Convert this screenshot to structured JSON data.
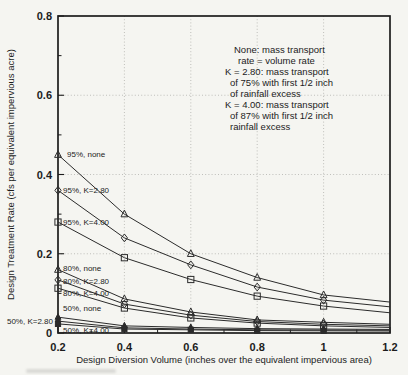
{
  "figure": {
    "background": "#f5f5f1",
    "frame_color": "#1d1d1d",
    "grid_color": "#b9b9b4",
    "line_color": "#2b2b2b",
    "text_color": "#1c1c1c"
  },
  "chart_data": {
    "type": "line",
    "title": "",
    "xlabel": "Design Diversion Volume (inches over the equivalent impervious area)",
    "ylabel": "Design Treatment Rate (cfs per equivalent impervious acre)",
    "xlim": [
      0.2,
      1.2
    ],
    "ylim": [
      0,
      0.8
    ],
    "x_ticks": [
      0.2,
      0.4,
      0.6,
      0.8,
      1.0,
      1.2
    ],
    "x_tick_labels": [
      "0.2",
      "0.4",
      "0.6",
      "0.8",
      "1",
      "1.2"
    ],
    "x_minor_ticks": [
      0.3,
      0.5,
      0.7,
      0.9,
      1.1
    ],
    "y_ticks": [
      0,
      0.2,
      0.4,
      0.6,
      0.8
    ],
    "y_tick_labels": [
      "0",
      "0.2",
      "0.4",
      "0.6",
      "0.8"
    ],
    "y_minor_ticks": [
      0.1,
      0.3,
      0.5,
      0.7
    ],
    "grid": "dotted at major ticks",
    "legend_position": "note block upper right inside plot",
    "x": [
      0.2,
      0.4,
      0.6,
      0.8,
      1.0,
      1.2
    ],
    "markers_on_last_point": false,
    "series": [
      {
        "name": "95%, none",
        "marker": "triangle-open",
        "values": [
          0.45,
          0.3,
          0.2,
          0.14,
          0.096,
          0.078
        ]
      },
      {
        "name": "95%, K=2.80",
        "marker": "diamond-open",
        "values": [
          0.36,
          0.24,
          0.172,
          0.116,
          0.083,
          0.066
        ]
      },
      {
        "name": "95%, K=4.00",
        "marker": "square-open",
        "values": [
          0.28,
          0.19,
          0.135,
          0.093,
          0.068,
          0.051
        ]
      },
      {
        "name": "80%, none",
        "marker": "triangle-open",
        "values": [
          0.16,
          0.086,
          0.053,
          0.033,
          0.027,
          0.022
        ]
      },
      {
        "name": "80%, K=2.80",
        "marker": "diamond-open",
        "values": [
          0.134,
          0.073,
          0.045,
          0.029,
          0.022,
          0.018
        ]
      },
      {
        "name": "80%, K=4.00",
        "marker": "square-open",
        "values": [
          0.113,
          0.063,
          0.038,
          0.025,
          0.018,
          0.014
        ]
      },
      {
        "name": "50%, none",
        "marker": "triangle-filled",
        "values": [
          0.04,
          0.018,
          0.014,
          0.011,
          0.01,
          0.009
        ]
      },
      {
        "name": "50%, K=2.80",
        "marker": "diamond-filled",
        "values": [
          0.03,
          0.013,
          0.01,
          0.008,
          0.0075,
          0.007
        ]
      },
      {
        "name": "50%, K=4.00",
        "marker": "square-filled",
        "values": [
          0.023,
          0.01,
          0.008,
          0.006,
          0.0055,
          0.005
        ]
      }
    ],
    "series_labels": [
      {
        "text": "95%, none",
        "x": 67,
        "y": 157,
        "anchor": "start"
      },
      {
        "text": "95%, K=2.80",
        "x": 63,
        "y": 193,
        "anchor": "start"
      },
      {
        "text": "95%, K=4.00",
        "x": 63,
        "y": 225,
        "anchor": "start"
      },
      {
        "text": "80%, none",
        "x": 63,
        "y": 271,
        "anchor": "start"
      },
      {
        "text": "80%, K=2.80",
        "x": 63,
        "y": 284,
        "anchor": "start"
      },
      {
        "text": "80%, K=4.00",
        "x": 63,
        "y": 296,
        "anchor": "start"
      },
      {
        "text": "50%, none",
        "x": 63,
        "y": 311,
        "anchor": "start"
      },
      {
        "text": "50%, K=2.80",
        "x": 53,
        "y": 324,
        "anchor": "end"
      },
      {
        "text": "50%, K=4.00",
        "x": 63,
        "y": 333,
        "anchor": "start"
      }
    ],
    "note": {
      "y0": 53,
      "line_height": 11,
      "lines": [
        {
          "text": "None: mass transport",
          "x": 234
        },
        {
          "text": "rate = volume rate",
          "x": 238
        },
        {
          "text": "K = 2.80: mass transport",
          "x": 225
        },
        {
          "text": "of 75% with first 1/2 inch",
          "x": 230
        },
        {
          "text": "of rainfall excess",
          "x": 230
        },
        {
          "text": "K = 4.00: mass transport",
          "x": 225
        },
        {
          "text": "of 87% with first 1/2 inch",
          "x": 230
        },
        {
          "text": "rainfall excess",
          "x": 230
        }
      ]
    }
  }
}
